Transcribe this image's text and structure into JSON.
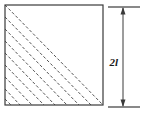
{
  "figure": {
    "background_color": "#ffffff",
    "line_color": "#3a3a3a",
    "hatch_color": "#555555",
    "label_color": "#1a1a1a",
    "square": {
      "name": "square-outline",
      "x": 5,
      "y": 5,
      "width": 98,
      "height": 100,
      "fill": "none",
      "stroke_width": 1.2
    },
    "hatching": {
      "name": "diagonal-hatch-lines",
      "description": "dashed parallel diagonal lines filling lower-left triangle",
      "line_count": 9,
      "dash_pattern": "3 2",
      "direction": "upper-left-to-lower-right",
      "lines": [
        {
          "x1": 5,
          "y1": 5,
          "x2": 103,
          "y2": 105
        },
        {
          "x1": 5,
          "y1": 17,
          "x2": 91,
          "y2": 105
        },
        {
          "x1": 5,
          "y1": 29,
          "x2": 79,
          "y2": 105
        },
        {
          "x1": 5,
          "y1": 41,
          "x2": 67,
          "y2": 105
        },
        {
          "x1": 5,
          "y1": 53,
          "x2": 55,
          "y2": 105
        },
        {
          "x1": 5,
          "y1": 65,
          "x2": 44,
          "y2": 105
        },
        {
          "x1": 5,
          "y1": 77,
          "x2": 32,
          "y2": 105
        },
        {
          "x1": 5,
          "y1": 89,
          "x2": 20,
          "y2": 105
        },
        {
          "x1": 5,
          "y1": 99,
          "x2": 11,
          "y2": 105
        }
      ]
    },
    "dimension": {
      "name": "height-dimension",
      "label": "2l",
      "label_x": 118,
      "label_y": 63,
      "arrow_x": 123,
      "arrow_top_y": 8,
      "arrow_bottom_y": 106,
      "extension_top": {
        "x1": 108,
        "y1": 7,
        "x2": 140,
        "y2": 7
      },
      "extension_bottom": {
        "x1": 108,
        "y1": 107,
        "x2": 140,
        "y2": 107
      },
      "arrowhead_size": 4
    }
  }
}
